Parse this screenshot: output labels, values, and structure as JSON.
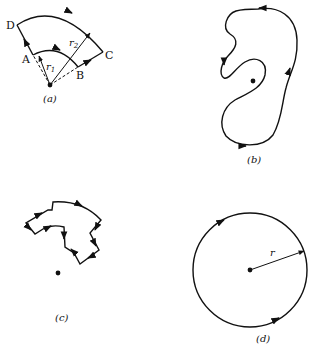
{
  "figure": {
    "panels": [
      {
        "id": "a",
        "caption": "(a)",
        "points": {
          "D": "D",
          "A": "A",
          "B": "B",
          "C": "C"
        },
        "radii": {
          "inner": "r",
          "inner_sub": "1",
          "outer": "r",
          "outer_sub": "2"
        },
        "description": "Annular sector path ABCD around a point charge, with radii r1 and r2"
      },
      {
        "id": "b",
        "caption": "(b)",
        "description": "Arbitrary closed loop not enclosing... the point inside a curved closed path"
      },
      {
        "id": "c",
        "caption": "(c)",
        "description": "Closed path made of radial and arc segments not enclosing the point"
      },
      {
        "id": "d",
        "caption": "(d)",
        "radius_label": "r",
        "description": "Circular path of radius r centered on the point"
      }
    ]
  }
}
